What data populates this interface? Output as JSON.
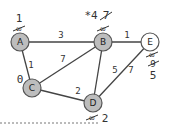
{
  "diagram": {
    "nodes": [
      {
        "id": "A",
        "label": "A",
        "x": 20,
        "y": 42,
        "fill": "#bdbdbd",
        "dist_current": "1",
        "dist_old": "∞"
      },
      {
        "id": "B",
        "label": "B",
        "x": 103,
        "y": 42,
        "fill": "#bdbdbd",
        "dist_current": "*4",
        "dist_old_struck": "7",
        "dist_old": "∞"
      },
      {
        "id": "C",
        "label": "C",
        "x": 32,
        "y": 88,
        "fill": "#bdbdbd",
        "dist_current": "0"
      },
      {
        "id": "D",
        "label": "D",
        "x": 93,
        "y": 103,
        "fill": "#bdbdbd",
        "dist_current": "2",
        "dist_old": "∞"
      },
      {
        "id": "E",
        "label": "E",
        "x": 150,
        "y": 42,
        "fill": "#ffffff",
        "dist_current": "5",
        "dist_old_struck": "9",
        "dist_old": "∞"
      }
    ],
    "edges": [
      {
        "from": "A",
        "to": "B",
        "weight": "3"
      },
      {
        "from": "A",
        "to": "C",
        "weight": "1"
      },
      {
        "from": "C",
        "to": "B",
        "weight": "7"
      },
      {
        "from": "C",
        "to": "D",
        "weight": "2"
      },
      {
        "from": "B",
        "to": "D",
        "weight": "5"
      },
      {
        "from": "B",
        "to": "E",
        "weight": "1"
      },
      {
        "from": "D",
        "to": "E",
        "weight": "7"
      }
    ]
  }
}
